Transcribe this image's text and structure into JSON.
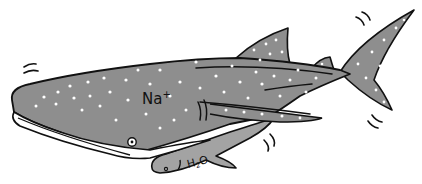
{
  "illustration": {
    "subject": "whale shark",
    "labels": {
      "ion": "Na",
      "ion_charge": "+",
      "small_mol": "H",
      "small_mol_sub": "2",
      "small_mol_end": "O"
    },
    "colors": {
      "body": "#8e8e8e",
      "fin": "#a3a3a3",
      "belly": "#ffffff",
      "outline": "#111111",
      "spots": "#ffffff",
      "background": "#ffffff"
    }
  }
}
